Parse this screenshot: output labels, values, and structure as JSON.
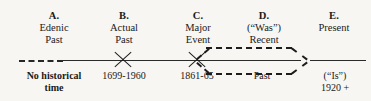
{
  "figure": {
    "type": "timeline-diagram",
    "background_color": "#f7f6f2",
    "ink_color": "#1d1d1d"
  },
  "stages": [
    {
      "key": "A",
      "letter": "A.",
      "line1": "Edenic",
      "line2": "Past",
      "below_line1": "No  historical",
      "below_line2": "time"
    },
    {
      "key": "B",
      "letter": "B.",
      "line1": "Actual",
      "line2": "Past",
      "below_line1": "1699-1960",
      "below_line2": ""
    },
    {
      "key": "C",
      "letter": "C.",
      "line1": "Major",
      "line2": "Event",
      "below_line1": "1861-65",
      "below_line2": ""
    },
    {
      "key": "D",
      "letter": "D.",
      "line1": "(“Was”)",
      "line2": "Recent",
      "below_line1": "Past",
      "below_line2": ""
    },
    {
      "key": "E",
      "letter": "E.",
      "line1": "Present",
      "line2": "",
      "below_line1": "(“Is”)",
      "below_line2": "1920  +"
    }
  ]
}
